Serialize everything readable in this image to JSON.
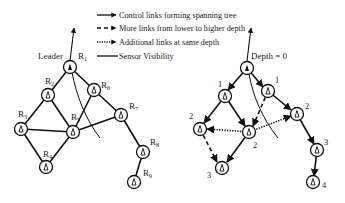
{
  "legend": [
    {
      "style": "solid-arrow",
      "label": "Control links forming spanning tree"
    },
    {
      "style": "dashed-arrow",
      "label": "More links from lower to higher depth"
    },
    {
      "style": "dotted-arrow",
      "label": "Additional links at same depth"
    },
    {
      "style": "solid-line",
      "label": "Sensor Visibility"
    }
  ],
  "left_graph": {
    "leader_label": "Leader",
    "nodes": [
      {
        "id": "R1",
        "label": "R",
        "sub": "1"
      },
      {
        "id": "R2",
        "label": "R",
        "sub": "2"
      },
      {
        "id": "R3",
        "label": "R",
        "sub": "3"
      },
      {
        "id": "R4",
        "label": "R",
        "sub": "4"
      },
      {
        "id": "R5",
        "label": "R",
        "sub": "5"
      },
      {
        "id": "R6",
        "label": "R",
        "sub": "6"
      },
      {
        "id": "R7",
        "label": "R",
        "sub": "7"
      },
      {
        "id": "R8",
        "label": "R",
        "sub": "8"
      },
      {
        "id": "R9",
        "label": "R",
        "sub": "9"
      }
    ]
  },
  "right_graph": {
    "root_label": "Depth = 0",
    "depths": [
      "1",
      "1",
      "2",
      "2",
      "2",
      "3",
      "3",
      "4"
    ]
  }
}
